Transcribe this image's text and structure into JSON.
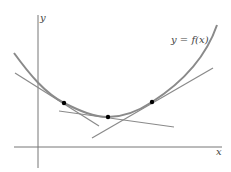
{
  "diagram": {
    "type": "tangent lines to a convex curve",
    "curve_label": "y = f(x)",
    "x_axis_label": "x",
    "y_axis_label": "y",
    "points_of_tangency": 3,
    "colors": {
      "curve": "#8a8a8a",
      "tangent": "#8a8a8a",
      "axis": "#777777",
      "point": "#000000"
    }
  }
}
